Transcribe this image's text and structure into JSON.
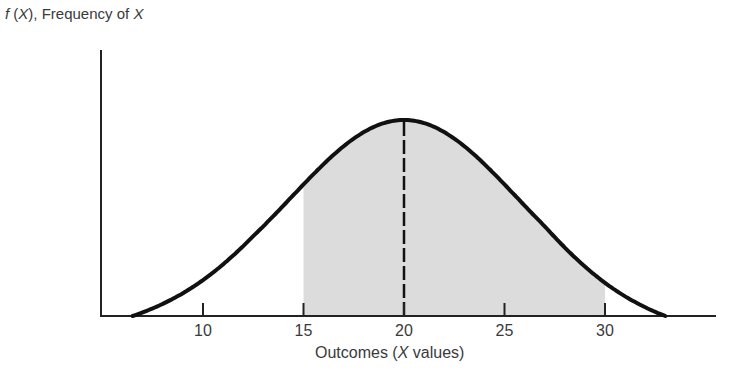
{
  "chart_data": {
    "type": "area",
    "title": "",
    "ylabel": "f (X), Frequency of X",
    "ylabel_parts": {
      "prefix": "f",
      "open": " (",
      "var": "X",
      "close": "), Frequency of ",
      "var2": "X"
    },
    "xlabel": "Outcomes (X values)",
    "xlabel_parts": {
      "prefix": "Outcomes (",
      "var": "X",
      "suffix": " values)"
    },
    "distribution": "normal",
    "mean": 20,
    "std_dev": 5.6,
    "x_range": [
      6.5,
      33
    ],
    "xticks": [
      10,
      15,
      20,
      25,
      30
    ],
    "xtick_labels": [
      "10",
      "15",
      "20",
      "25",
      "30"
    ],
    "shaded_region": {
      "from": 15,
      "to": 30,
      "color": "#dcdcdc"
    },
    "mean_line": {
      "x": 20,
      "style": "dashed"
    },
    "grid": false,
    "legend": null,
    "curve_color": "#111111",
    "axis_color": "#222222"
  }
}
